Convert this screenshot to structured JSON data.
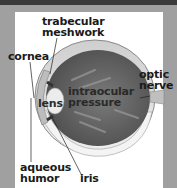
{
  "diagram": {
    "colors": {
      "frame": "#a0a0a0",
      "top_band": "#3b3b3b",
      "panel": "#ffffff",
      "eyeball_interior": "#6e6e6e",
      "sclera": "#d9d9d9",
      "lens": "#ededed",
      "label_text": "#1a1a1a"
    },
    "labels": {
      "trabecular_meshwork_line1": "trabecular",
      "trabecular_meshwork_line2": "meshwork",
      "cornea": "cornea",
      "optic_nerve_line1": "optic",
      "optic_nerve_line2": "nerve",
      "lens": "lens",
      "intraocular_pressure_line1": "intraocular",
      "intraocular_pressure_line2": "pressure",
      "aqueous_humor_line1": "aqueous",
      "aqueous_humor_line2": "humor",
      "iris": "iris"
    }
  }
}
